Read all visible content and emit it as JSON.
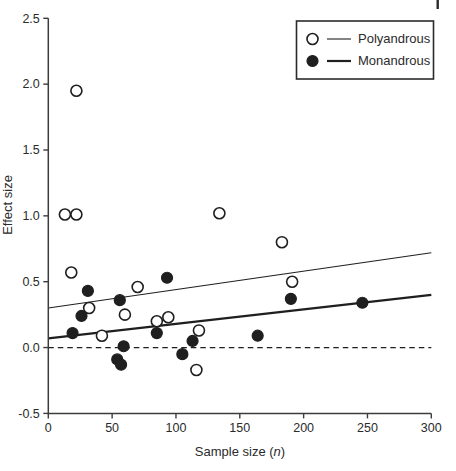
{
  "page": {
    "corner_artifact": "|"
  },
  "chart_data": {
    "type": "scatter",
    "title": "",
    "xlabel_prefix": "Sample size (",
    "xlabel_var": "n",
    "xlabel_suffix": ")",
    "ylabel": "Effect size",
    "xlim": [
      0,
      300
    ],
    "ylim": [
      -0.5,
      2.5
    ],
    "xticks": [
      0,
      50,
      100,
      150,
      200,
      250,
      300
    ],
    "yticks": [
      -0.5,
      0,
      0.5,
      1,
      1.5,
      2,
      2.5
    ],
    "grid": false,
    "legend_position": "top-right",
    "zero_line": {
      "y": 0,
      "style": "dashed"
    },
    "series": [
      {
        "name": "Polyandrous",
        "marker": "open-circle",
        "trend_line": "thin",
        "points": [
          [
            22,
            1.95
          ],
          [
            13,
            1.01
          ],
          [
            22,
            1.01
          ],
          [
            134,
            1.02
          ],
          [
            183,
            0.8
          ],
          [
            18,
            0.57
          ],
          [
            70,
            0.46
          ],
          [
            191,
            0.5
          ],
          [
            32,
            0.3
          ],
          [
            60,
            0.25
          ],
          [
            85,
            0.2
          ],
          [
            94,
            0.23
          ],
          [
            42,
            0.09
          ],
          [
            118,
            0.13
          ],
          [
            116,
            -0.17
          ]
        ],
        "trend": {
          "x0": 0,
          "y0": 0.3,
          "x1": 300,
          "y1": 0.72
        }
      },
      {
        "name": "Monandrous",
        "marker": "filled-circle",
        "trend_line": "thick",
        "points": [
          [
            31,
            0.43
          ],
          [
            56,
            0.36
          ],
          [
            93,
            0.53
          ],
          [
            26,
            0.24
          ],
          [
            19,
            0.11
          ],
          [
            85,
            0.11
          ],
          [
            59,
            0.01
          ],
          [
            54,
            -0.09
          ],
          [
            57,
            -0.13
          ],
          [
            105,
            -0.05
          ],
          [
            113,
            0.05
          ],
          [
            164,
            0.09
          ],
          [
            190,
            0.37
          ],
          [
            246,
            0.34
          ]
        ],
        "trend": {
          "x0": 0,
          "y0": 0.07,
          "x1": 300,
          "y1": 0.4
        }
      }
    ],
    "colors": {
      "ink": "#1f1f1f",
      "axis": "#3c3c3c",
      "text": "#2b2b2b",
      "background": "#ffffff"
    }
  }
}
